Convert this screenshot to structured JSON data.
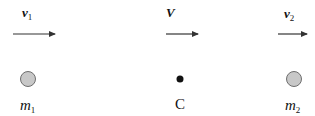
{
  "diagram": {
    "title": "",
    "velocities": [
      {
        "symbol": "v",
        "subscript": "1",
        "label": "v1"
      },
      {
        "symbol": "V",
        "subscript": "",
        "label": "V"
      },
      {
        "symbol": "v",
        "subscript": "2",
        "label": "v2"
      }
    ],
    "bodies": [
      {
        "symbol": "m",
        "subscript": "1",
        "label": "m1",
        "type": "mass"
      },
      {
        "symbol": "C",
        "subscript": "",
        "label": "C",
        "type": "center-of-mass"
      },
      {
        "symbol": "m",
        "subscript": "2",
        "label": "m2",
        "type": "mass"
      }
    ],
    "colors": {
      "mass_fill": "#c8c8c8",
      "mass_stroke": "#6e6e6e",
      "com_fill": "#111111",
      "arrow": "#333333"
    }
  }
}
